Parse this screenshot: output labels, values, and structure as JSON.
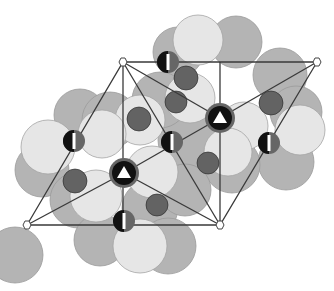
{
  "diagram": {
    "title": "Crystal structure projection",
    "colors": {
      "background": "#ffffff",
      "large_light": "#e6e6e6",
      "large_mid": "#b4b4b4",
      "large_dark": "#a0a0a0",
      "small_atom": "#636363",
      "cation": "#111111",
      "line": "#3a3a3a",
      "marker_fill": "#ffffff"
    },
    "unit_cell_corners": [
      {
        "x": 123,
        "y": 62
      },
      {
        "x": 317,
        "y": 62
      },
      {
        "x": 220,
        "y": 225
      },
      {
        "x": 27,
        "y": 225
      }
    ],
    "threefold_sites": [
      {
        "x": 124,
        "y": 173,
        "symbol": "triangle"
      },
      {
        "x": 220,
        "y": 118,
        "symbol": "triangle"
      }
    ],
    "twofold_sites": [
      {
        "x": 74,
        "y": 141
      },
      {
        "x": 172,
        "y": 142
      },
      {
        "x": 168,
        "y": 62
      },
      {
        "x": 269,
        "y": 143
      },
      {
        "x": 124,
        "y": 221
      }
    ]
  }
}
